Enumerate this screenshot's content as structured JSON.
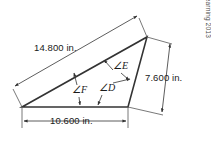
{
  "figure": {
    "type": "geometry-diagram",
    "shape": "triangle",
    "dimensions": [
      {
        "id": "hypotenuse",
        "label": "14.800 in.",
        "value": 14.8,
        "unit": "in.",
        "side": "upper-left-slant"
      },
      {
        "id": "right-side",
        "label": "7.600 in.",
        "value": 7.6,
        "unit": "in.",
        "side": "right-slant"
      },
      {
        "id": "base",
        "label": "10.600 in.",
        "value": 10.6,
        "unit": "in.",
        "side": "bottom"
      }
    ],
    "angles": [
      {
        "id": "angle-d",
        "label": "∠D",
        "name": "D"
      },
      {
        "id": "angle-e",
        "label": "∠E",
        "name": "E"
      },
      {
        "id": "angle-f",
        "label": "∠F",
        "name": "F"
      }
    ],
    "credit": "© Cengage Learning 2013",
    "colors": {
      "stroke": "#333333",
      "thin_stroke": "#555555",
      "text": "#1a1a1a",
      "credit_text": "#4a4a4a",
      "background": "#ffffff"
    }
  }
}
